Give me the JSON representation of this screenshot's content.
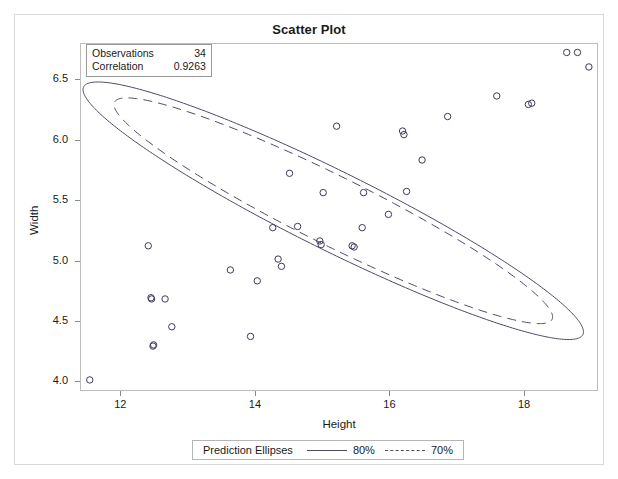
{
  "chart_data": {
    "type": "scatter",
    "title": "Scatter Plot",
    "xlabel": "Height",
    "ylabel": "Width",
    "xlim": [
      11.4,
      19.1
    ],
    "ylim": [
      3.92,
      6.8
    ],
    "xticks": [
      12,
      14,
      16,
      18
    ],
    "xtick_labels": [
      "12",
      "14",
      "16",
      "18"
    ],
    "yticks": [
      4.0,
      4.5,
      5.0,
      5.5,
      6.0,
      6.5
    ],
    "ytick_labels": [
      "4.0",
      "4.5",
      "5.0",
      "5.5",
      "6.0",
      "6.5"
    ],
    "grid": false,
    "legend_position": "bottom",
    "marker": "open-circle",
    "points": [
      {
        "x": 11.53,
        "y": 4.02
      },
      {
        "x": 12.4,
        "y": 5.13
      },
      {
        "x": 12.44,
        "y": 4.7
      },
      {
        "x": 12.45,
        "y": 4.69
      },
      {
        "x": 12.47,
        "y": 4.3
      },
      {
        "x": 12.48,
        "y": 4.31
      },
      {
        "x": 12.65,
        "y": 4.69
      },
      {
        "x": 12.75,
        "y": 4.46
      },
      {
        "x": 13.62,
        "y": 4.93
      },
      {
        "x": 13.92,
        "y": 4.38
      },
      {
        "x": 14.02,
        "y": 4.84
      },
      {
        "x": 14.25,
        "y": 5.28
      },
      {
        "x": 14.33,
        "y": 5.02
      },
      {
        "x": 14.38,
        "y": 4.96
      },
      {
        "x": 14.5,
        "y": 5.73
      },
      {
        "x": 14.62,
        "y": 5.29
      },
      {
        "x": 14.95,
        "y": 5.17
      },
      {
        "x": 14.97,
        "y": 5.14
      },
      {
        "x": 15.0,
        "y": 5.57
      },
      {
        "x": 15.2,
        "y": 6.12
      },
      {
        "x": 15.43,
        "y": 5.13
      },
      {
        "x": 15.46,
        "y": 5.12
      },
      {
        "x": 15.58,
        "y": 5.28
      },
      {
        "x": 15.6,
        "y": 5.57
      },
      {
        "x": 15.97,
        "y": 5.39
      },
      {
        "x": 16.18,
        "y": 6.08
      },
      {
        "x": 16.2,
        "y": 6.05
      },
      {
        "x": 16.24,
        "y": 5.58
      },
      {
        "x": 16.47,
        "y": 5.84
      },
      {
        "x": 16.85,
        "y": 6.2
      },
      {
        "x": 17.58,
        "y": 6.37
      },
      {
        "x": 18.05,
        "y": 6.3
      },
      {
        "x": 18.1,
        "y": 6.31
      },
      {
        "x": 18.62,
        "y": 6.73
      },
      {
        "x": 18.78,
        "y": 6.73
      },
      {
        "x": 18.95,
        "y": 6.61
      }
    ],
    "statistics": {
      "observations_label": "Observations",
      "observations_value": "34",
      "correlation_label": "Correlation",
      "correlation_value": "0.9263"
    },
    "ellipses": {
      "legend_title": "Prediction Ellipses",
      "entries": [
        {
          "label": "80%",
          "style": "solid"
        },
        {
          "label": "70%",
          "style": "dashed"
        }
      ],
      "center": {
        "x": 15.15,
        "y": 5.42
      },
      "angle_deg": -37.0,
      "solid": {
        "semi_major": 4.62,
        "semi_minor": 0.78
      },
      "dashed": {
        "semi_major": 4.05,
        "semi_minor": 0.68
      }
    },
    "colors": {
      "line": "#4a4a6a",
      "marker": "#3a3a5a",
      "frame": "#bdbdbd",
      "text": "#1a1a1a"
    }
  }
}
